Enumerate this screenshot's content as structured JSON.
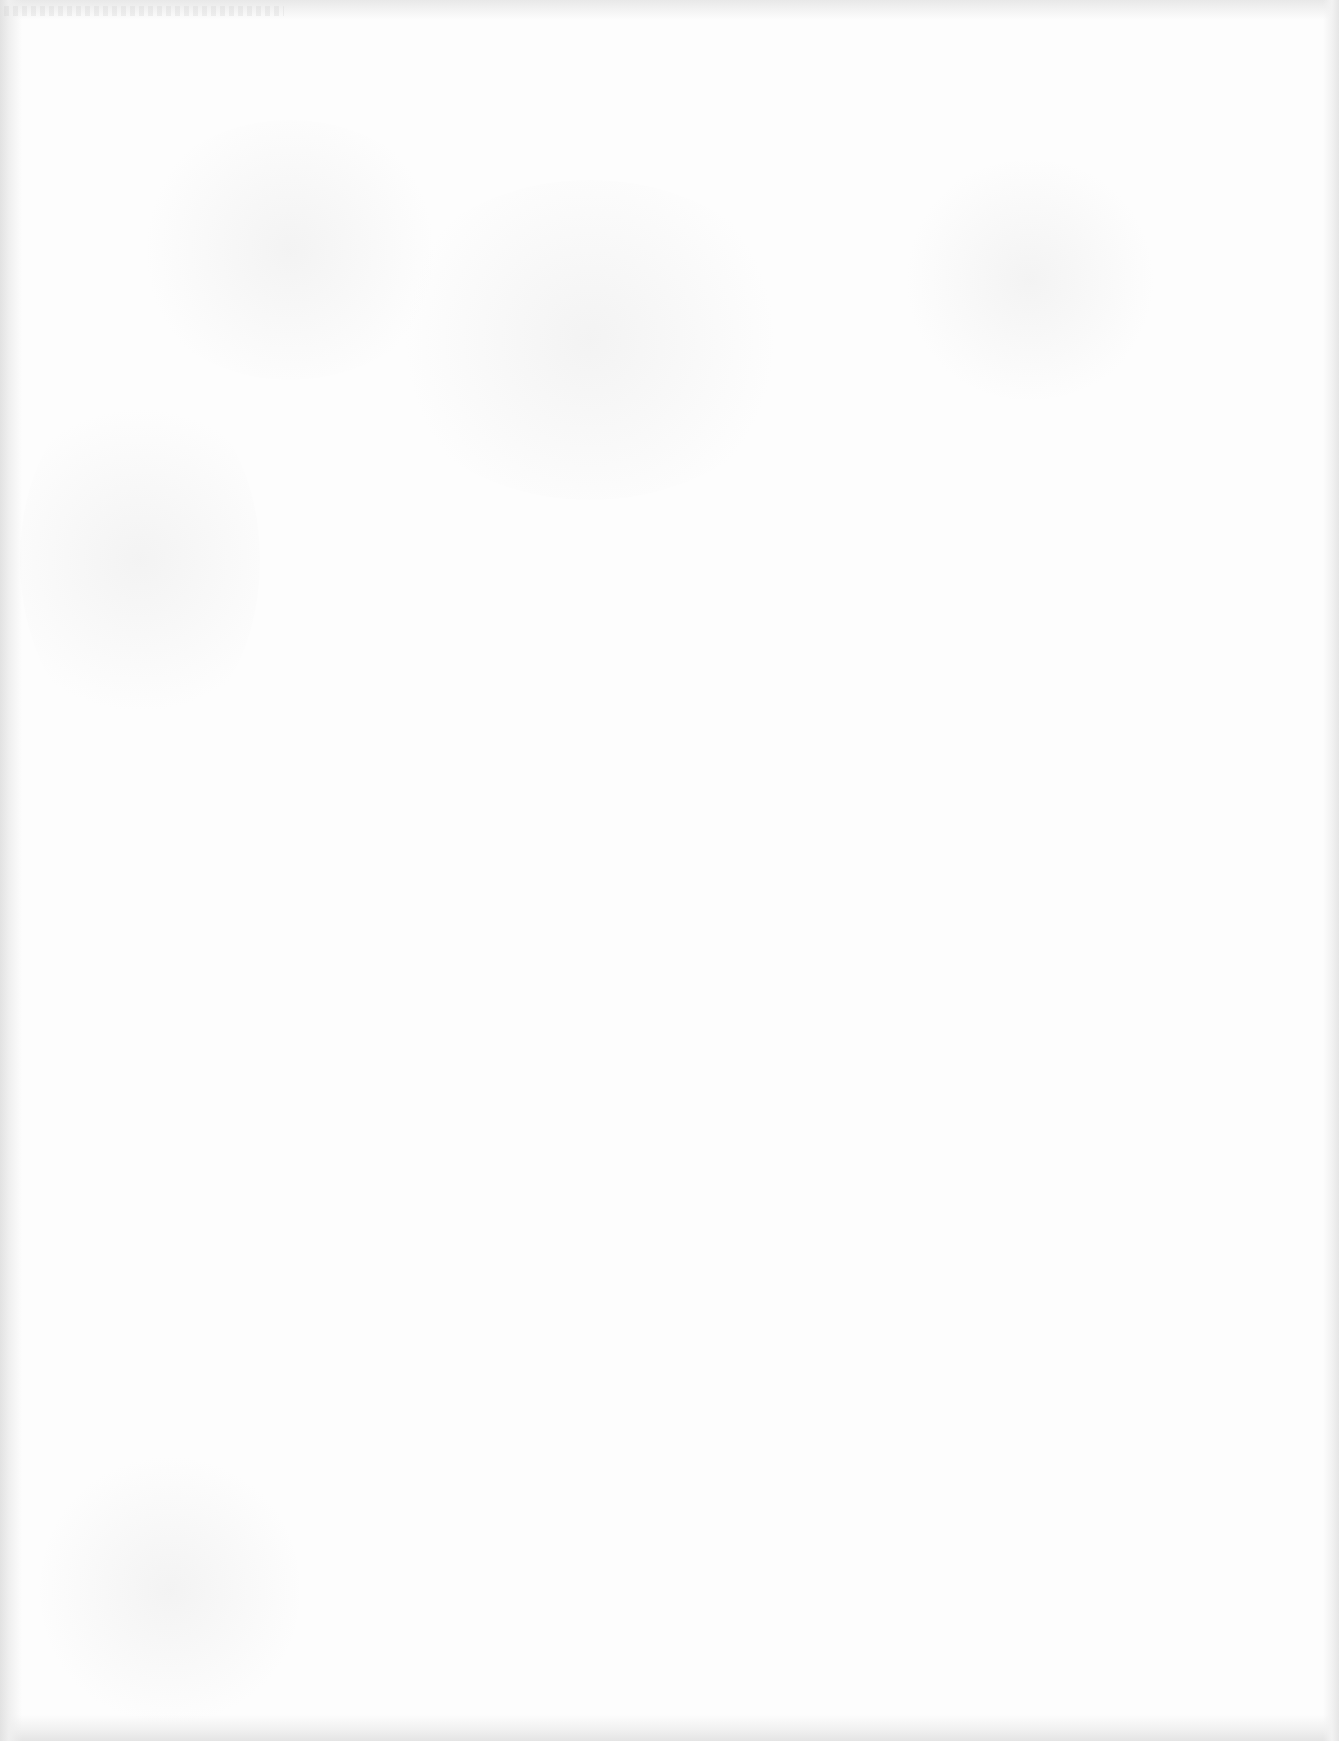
{
  "page": {
    "type": "scanned-blank-page",
    "background_color": "#fdfdfd",
    "edge_shade_color": "#e4e4e4",
    "visible_text": []
  }
}
